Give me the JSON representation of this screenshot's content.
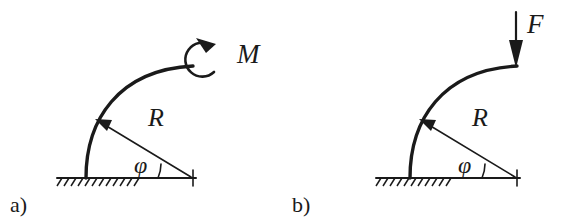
{
  "figure": {
    "background_color": "#ffffff",
    "ink_color": "#1a1a1a",
    "width": 564,
    "height": 224
  },
  "panels": [
    {
      "id": "panel-a",
      "caption": "a)",
      "load_type": "moment",
      "load_label": "M",
      "load_direction": "counterclockwise",
      "radius_label": "R",
      "angle_label": "φ",
      "support": "fixed-hatched-ground",
      "beam_shape": "quarter-circle-arc",
      "geometry": {
        "center_x": 193,
        "center_y": 178,
        "radius": 108,
        "arc_start_deg": 180,
        "arc_end_deg": 90,
        "phi_deg": 22,
        "baseline_x1": 57,
        "baseline_x2": 196,
        "baseline_y": 178,
        "hatch_x1": 58,
        "hatch_x2": 133,
        "base_x": 86
      }
    },
    {
      "id": "panel-b",
      "caption": "b)",
      "load_type": "force",
      "load_label": "F",
      "load_direction": "downward",
      "radius_label": "R",
      "angle_label": "φ",
      "support": "fixed-hatched-ground",
      "beam_shape": "quarter-circle-arc",
      "geometry": {
        "center_x": 517,
        "center_y": 178,
        "radius": 108,
        "arc_start_deg": 180,
        "arc_end_deg": 90,
        "phi_deg": 22,
        "baseline_x1": 376,
        "baseline_x2": 520,
        "baseline_y": 178,
        "hatch_x1": 377,
        "hatch_x2": 450,
        "base_x": 410
      }
    }
  ]
}
